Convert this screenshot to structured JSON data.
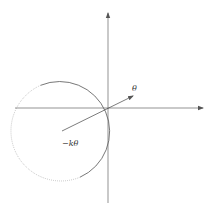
{
  "diagram": {
    "type": "vector-angle-diagram",
    "labels": {
      "theta": "θ",
      "neg_k_theta": "−kθ"
    },
    "axes": {
      "origin": [
        108,
        108
      ],
      "x_axis": {
        "from": [
          15,
          108
        ],
        "to": [
          203,
          108
        ],
        "arrow": true
      },
      "y_axis": {
        "from": [
          108,
          203
        ],
        "to": [
          108,
          12
        ],
        "arrow": true
      }
    },
    "circle": {
      "center": [
        61,
        131
      ],
      "radius": 50,
      "solid_arc_color": "#555555",
      "dotted_arc_color": "#aaaaaa"
    },
    "vector": {
      "from": [
        62,
        131
      ],
      "to": [
        133,
        96
      ],
      "color": "#444444"
    },
    "colors": {
      "axis": "#666666",
      "background": "#ffffff",
      "text": "#333333"
    }
  }
}
